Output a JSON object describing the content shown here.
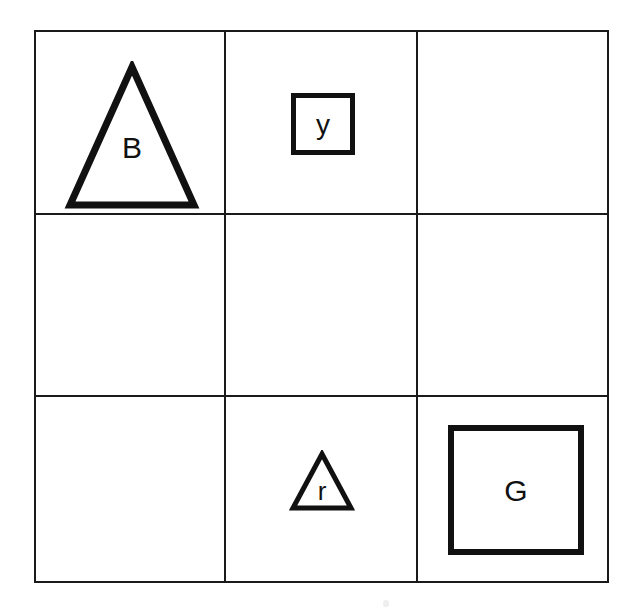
{
  "figure": {
    "background_color": "#ffffff",
    "stroke_color": "#1a1a1a",
    "text_color": "#111111",
    "width": 638,
    "height": 614
  },
  "grid": {
    "rows": 3,
    "columns": 3,
    "line_color": "#1a1a1a",
    "outer_border_width_px": 2,
    "inner_line_width_px": 2
  },
  "cells": [
    {
      "row": 0,
      "column": 0,
      "occupied": true,
      "shape": "triangle",
      "size": "large",
      "label": "B"
    },
    {
      "row": 0,
      "column": 1,
      "occupied": true,
      "shape": "square",
      "size": "small",
      "label": "y"
    },
    {
      "row": 0,
      "column": 2,
      "occupied": false,
      "shape": "",
      "size": "",
      "label": ""
    },
    {
      "row": 1,
      "column": 0,
      "occupied": false,
      "shape": "",
      "size": "",
      "label": ""
    },
    {
      "row": 1,
      "column": 1,
      "occupied": false,
      "shape": "",
      "size": "",
      "label": ""
    },
    {
      "row": 1,
      "column": 2,
      "occupied": false,
      "shape": "",
      "size": "",
      "label": ""
    },
    {
      "row": 2,
      "column": 0,
      "occupied": false,
      "shape": "",
      "size": "",
      "label": ""
    },
    {
      "row": 2,
      "column": 1,
      "occupied": true,
      "shape": "triangle",
      "size": "small",
      "label": "r"
    },
    {
      "row": 2,
      "column": 2,
      "occupied": true,
      "shape": "square",
      "size": "large",
      "label": "G"
    }
  ]
}
